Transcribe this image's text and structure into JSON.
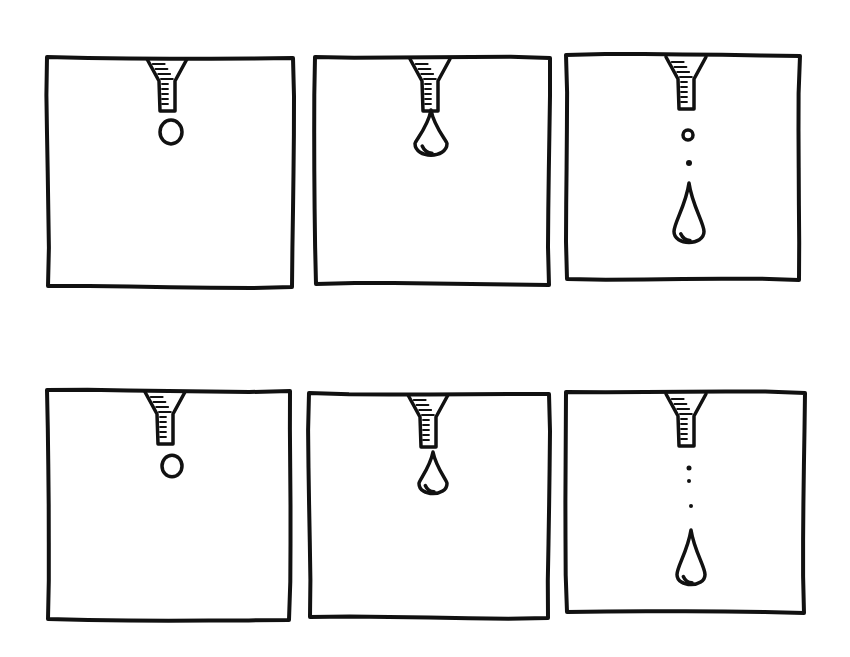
{
  "diagram": {
    "type": "sequence-of-panels",
    "rows": [
      {
        "panels": [
          {
            "id": "r1p1",
            "stage": "small round drop at nozzle tip",
            "box": [
              47,
              57,
              293,
              287
            ],
            "nozzle_x": 167,
            "drop": {
              "type": "round",
              "cx": 171,
              "cy": 132,
              "r": 11
            },
            "satellites": []
          },
          {
            "id": "r1p2",
            "stage": "enlarged pendant drop attached",
            "box": [
              315,
              57,
              550,
              285
            ],
            "nozzle_x": 430,
            "drop": {
              "type": "tear",
              "cx": 431,
              "top": 110,
              "bottom": 158,
              "w": 32
            },
            "satellites": []
          },
          {
            "id": "r1p3",
            "stage": "drop detached with satellite droplets",
            "box": [
              566,
              55,
              800,
              280
            ],
            "nozzle_x": 686,
            "drop": {
              "type": "tear",
              "cx": 689,
              "top": 183,
              "bottom": 245,
              "w": 30
            },
            "satellites": [
              {
                "cx": 688,
                "cy": 135,
                "r": 5,
                "hollow": true
              },
              {
                "cx": 689,
                "cy": 163,
                "r": 3,
                "hollow": false
              }
            ]
          }
        ]
      },
      {
        "panels": [
          {
            "id": "r2p1",
            "stage": "small round drop at nozzle tip",
            "box": [
              47,
              390,
              290,
              620
            ],
            "nozzle_x": 165,
            "drop": {
              "type": "round",
              "cx": 172,
              "cy": 466,
              "r": 10
            },
            "satellites": []
          },
          {
            "id": "r2p2",
            "stage": "enlarged pendant drop attached",
            "box": [
              309,
              393,
              549,
              618
            ],
            "nozzle_x": 428,
            "drop": {
              "type": "tear",
              "cx": 433,
              "top": 452,
              "bottom": 496,
              "w": 28
            },
            "satellites": []
          },
          {
            "id": "r2p3",
            "stage": "drop detached with satellite droplets",
            "box": [
              566,
              392,
              805,
              613
            ],
            "nozzle_x": 686,
            "drop": {
              "type": "tear",
              "cx": 691,
              "top": 530,
              "bottom": 587,
              "w": 28
            },
            "satellites": [
              {
                "cx": 689,
                "cy": 468,
                "r": 2.5,
                "hollow": false
              },
              {
                "cx": 689,
                "cy": 481,
                "r": 2,
                "hollow": false
              },
              {
                "cx": 691,
                "cy": 506,
                "r": 2,
                "hollow": false
              }
            ]
          }
        ]
      }
    ],
    "colors": {
      "ink": "#111111",
      "background": "#ffffff"
    }
  }
}
